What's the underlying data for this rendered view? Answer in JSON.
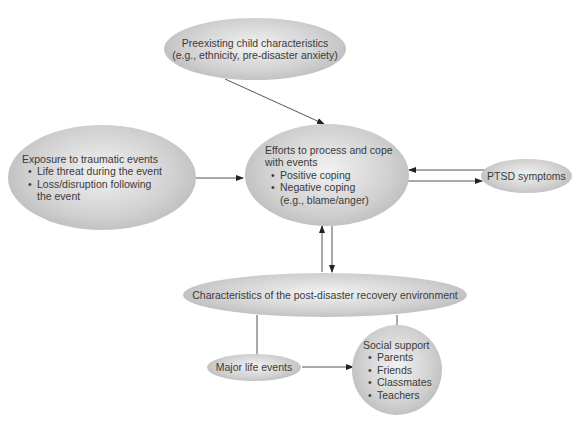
{
  "diagram": {
    "nodes": {
      "preexisting": {
        "title": "Preexisting child characteristics",
        "subtitle": "(e.g., ethnicity, pre-disaster anxiety)"
      },
      "exposure": {
        "title": "Exposure to traumatic events",
        "items": [
          "Life threat during the event",
          "Loss/disruption following",
          "the event"
        ]
      },
      "coping": {
        "title_line1": "Efforts to process and cope",
        "title_line2": "with events",
        "items": [
          "Positive coping",
          "Negative coping"
        ],
        "note": "(e.g., blame/anger)"
      },
      "ptsd": {
        "title": "PTSD symptoms"
      },
      "recovery": {
        "title": "Characteristics of the post-disaster recovery environment"
      },
      "life_events": {
        "title": "Major life events"
      },
      "social_support": {
        "title": "Social support",
        "items": [
          "Parents",
          "Friends",
          "Classmates",
          "Teachers"
        ]
      }
    },
    "edges": [
      {
        "from": "preexisting",
        "to": "coping",
        "type": "arrow"
      },
      {
        "from": "exposure",
        "to": "coping",
        "type": "arrow"
      },
      {
        "from": "ptsd",
        "to": "coping",
        "type": "arrow"
      },
      {
        "from": "coping",
        "to": "ptsd",
        "type": "arrow"
      },
      {
        "from": "recovery",
        "to": "coping",
        "type": "arrow"
      },
      {
        "from": "coping",
        "to": "recovery",
        "type": "arrow"
      },
      {
        "from": "recovery",
        "to": "life_events",
        "type": "line"
      },
      {
        "from": "recovery",
        "to": "social_support",
        "type": "line"
      },
      {
        "from": "life_events",
        "to": "social_support",
        "type": "arrow"
      }
    ],
    "colors": {
      "node_fill_light": "#f2f2f2",
      "node_fill_dark": "#a9a9a9",
      "line": "#555555"
    }
  }
}
